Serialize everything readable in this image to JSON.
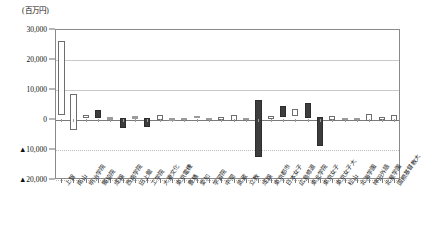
{
  "chart_data": {
    "type": "bar",
    "title": "",
    "subtitle": "",
    "unit_caption": "(百万円)",
    "xlabel": "",
    "ylabel": "",
    "ylim": [
      -20000,
      30000
    ],
    "y_ticks": [
      30000,
      20000,
      10000,
      0,
      -10000,
      -20000
    ],
    "y_tick_labels": [
      "30,000",
      "20,000",
      "10,000",
      "0",
      "▲10,000",
      "▲20,000"
    ],
    "grid": true,
    "legend": "none",
    "bar_style": "floating-range",
    "note": "各大学の金額レンジを示す浮動バー（上端=最大値、下端=最小値）",
    "categories": [
      "上智",
      "南山",
      "明治学院",
      "獨協院",
      "成蹊",
      "西南学院",
      "田上館",
      "工学院",
      "大妻文化",
      "東京電機",
      "豊橋",
      "愛知",
      "学習院",
      "中間",
      "武蔵",
      "立教",
      "成蹊",
      "東京都市",
      "日本女子",
      "広島修道",
      "東北学院",
      "東京女子",
      "東京女子大",
      "松山",
      "北海学園",
      "神田外語",
      "北星学園",
      "国際基督教大"
    ],
    "series": [
      {
        "name": "上端値（最大）",
        "values": [
          26000,
          8500,
          1200,
          3000,
          600,
          350,
          900,
          300,
          1400,
          250,
          500,
          900,
          400,
          600,
          1300,
          300,
          6500,
          1100,
          4200,
          3300,
          5200,
          700,
          900,
          300,
          200,
          1600,
          800,
          1500
        ]
      },
      {
        "name": "下端値（最小）",
        "values": [
          1500,
          -3500,
          200,
          400,
          -300,
          -3100,
          150,
          -2700,
          -200,
          -600,
          -200,
          200,
          -200,
          -500,
          -600,
          -200,
          -12500,
          100,
          600,
          900,
          400,
          -9000,
          -400,
          -300,
          -400,
          -700,
          -200,
          -600
        ]
      }
    ]
  }
}
